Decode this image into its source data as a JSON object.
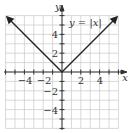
{
  "chart_data": {
    "type": "line",
    "title": "",
    "annotation": "y = |x|",
    "xlabel": "x",
    "ylabel": "y",
    "xlim": [
      -6,
      6
    ],
    "ylim": [
      -6,
      6
    ],
    "grid": true,
    "x_ticks": [
      -4,
      -2,
      2,
      4
    ],
    "y_ticks": [
      4,
      2,
      -2,
      -4
    ],
    "series": [
      {
        "name": "y = |x|",
        "x": [
          -6,
          0,
          6
        ],
        "y": [
          6,
          0,
          6
        ],
        "arrows": "both"
      }
    ]
  },
  "labels": {
    "annotation": "y = |x|",
    "x_axis": "x",
    "y_axis": "y",
    "xt": [
      "−4",
      "−2",
      "2",
      "4"
    ],
    "yt": [
      "4",
      "2",
      "−2",
      "−4"
    ]
  }
}
